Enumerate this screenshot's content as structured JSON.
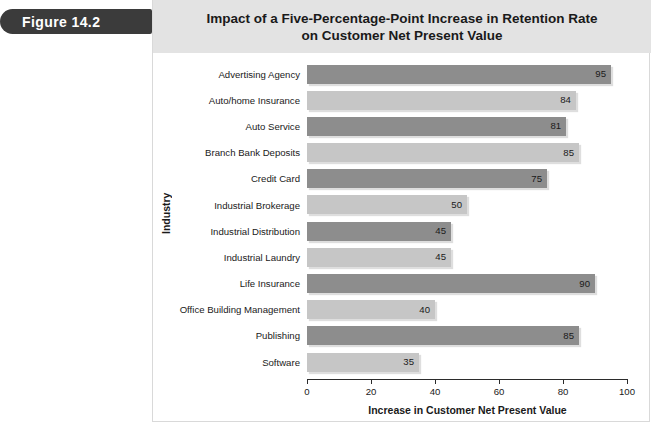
{
  "figure": {
    "badge_label": "Figure 14.2"
  },
  "chart_data": {
    "type": "bar",
    "orientation": "horizontal",
    "title": "Impact of a Five-Percentage-Point Increase in Retention Rate on Customer Net Present Value",
    "title_lines": [
      "Impact of a Five-Percentage-Point Increase in Retention Rate",
      "on Customer Net Present Value"
    ],
    "xlabel": "Increase in Customer Net Present Value",
    "ylabel": "Industry",
    "xlim": [
      0,
      100
    ],
    "xticks": [
      0,
      20,
      40,
      60,
      80,
      100
    ],
    "xtick_labels": [
      "0",
      "20",
      "40",
      "60",
      "80",
      "100"
    ],
    "grid": false,
    "legend": "none",
    "categories": [
      "Advertising Agency",
      "Auto/home Insurance",
      "Auto Service",
      "Branch Bank Deposits",
      "Credit Card",
      "Industrial Brokerage",
      "Industrial Distribution",
      "Industrial Laundry",
      "Life Insurance",
      "Office Building Management",
      "Publishing",
      "Software"
    ],
    "values": [
      95,
      84,
      81,
      85,
      75,
      50,
      45,
      45,
      90,
      40,
      85,
      35
    ],
    "value_labels": [
      "95",
      "84",
      "81",
      "85",
      "75",
      "50",
      "45",
      "45",
      "90",
      "40",
      "85",
      "35"
    ],
    "bar_shades": [
      "dark",
      "light",
      "dark",
      "light",
      "dark",
      "light",
      "dark",
      "light",
      "dark",
      "light",
      "dark",
      "light"
    ],
    "colors": {
      "bar_dark": "#8d8d8d",
      "bar_light": "#c6c6c6",
      "title_band": "#e3e3e3",
      "badge": "#3b3b3b",
      "axis": "#2b2b2b",
      "panel_border": "#d9d9d9"
    }
  }
}
